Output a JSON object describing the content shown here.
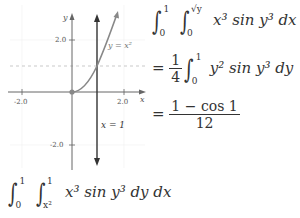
{
  "graph": {
    "y_axis_label": "y",
    "x_axis_label": "x",
    "x_ticks": [
      "-2.0",
      "2.0"
    ],
    "y_ticks": [
      "2.0",
      "-2.0"
    ],
    "curve_label": "y = x²",
    "line_label": "x = 1",
    "colors": {
      "axis": "#666666",
      "curve": "#888888",
      "line": "#333333",
      "dashed": "#bbbbbb",
      "point": "#777777"
    }
  },
  "integrals": {
    "top": {
      "outer_upper": "1",
      "outer_lower": "0",
      "inner_upper": "√y",
      "inner_lower": "0",
      "integrand": "x³ sin y³ dx dy"
    },
    "step2": {
      "equals": "=",
      "coef_num": "1",
      "coef_den": "4",
      "upper": "1",
      "lower": "0",
      "integrand": "y² sin y³ dy"
    },
    "step3": {
      "equals": "=",
      "num": "1 − cos 1",
      "den": "12"
    },
    "bottom": {
      "outer_upper": "1",
      "outer_lower": "0",
      "inner_upper": "1",
      "inner_lower": "x²",
      "integrand": "x³ sin y³ dy dx"
    }
  }
}
